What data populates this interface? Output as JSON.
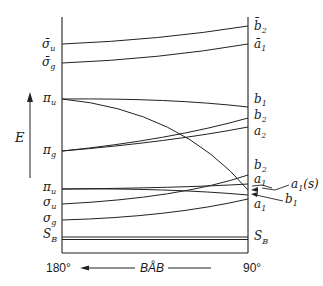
{
  "diagram": {
    "type": "correlation-diagram",
    "energy_axis_label": "E",
    "x_axis": {
      "left_value": "180°",
      "right_value": "90°",
      "label": "BÅB",
      "arrow_direction": "left"
    },
    "left_levels": [
      {
        "id": "sigma_u_star",
        "symbol": "σ̄",
        "sub": "u"
      },
      {
        "id": "sigma_g_star",
        "symbol": "σ̄",
        "sub": "g"
      },
      {
        "id": "pi_u_upper",
        "symbol": "π",
        "sub": "u"
      },
      {
        "id": "pi_g",
        "symbol": "π",
        "sub": "g"
      },
      {
        "id": "pi_u_lower",
        "symbol": "π",
        "sub": "u"
      },
      {
        "id": "sigma_u",
        "symbol": "σ",
        "sub": "u"
      },
      {
        "id": "sigma_g",
        "symbol": "σ",
        "sub": "g"
      },
      {
        "id": "S_B_left",
        "symbol": "S",
        "sub": "B"
      }
    ],
    "right_levels": [
      {
        "id": "b2_star",
        "symbol": "b̄",
        "sub": "2"
      },
      {
        "id": "a1_star",
        "symbol": "ā",
        "sub": "1"
      },
      {
        "id": "b1_upper",
        "symbol": "b",
        "sub": "1"
      },
      {
        "id": "b2_upper",
        "symbol": "b",
        "sub": "2"
      },
      {
        "id": "a2",
        "symbol": "a",
        "sub": "2"
      },
      {
        "id": "b2_lower",
        "symbol": "b",
        "sub": "2"
      },
      {
        "id": "a1_mid",
        "symbol": "a",
        "sub": "1"
      },
      {
        "id": "a1_lower",
        "symbol": "a",
        "sub": "1"
      },
      {
        "id": "S_B_right",
        "symbol": "S",
        "sub": "B"
      }
    ],
    "callouts": [
      {
        "id": "a1s",
        "symbol": "a",
        "sub": "1",
        "suffix": "(s)"
      },
      {
        "id": "b1_callout",
        "symbol": "b",
        "sub": "1"
      }
    ],
    "correlations": [
      {
        "from": "σ̄u",
        "to": "b̄2"
      },
      {
        "from": "σ̄g",
        "to": "ā1"
      },
      {
        "from": "πu",
        "to": "b1"
      },
      {
        "from": "πu",
        "to": "a1(s)"
      },
      {
        "from": "πg",
        "to": "b2"
      },
      {
        "from": "πg",
        "to": "a2"
      },
      {
        "from": "πu",
        "to": "a1"
      },
      {
        "from": "πu",
        "to": "b1"
      },
      {
        "from": "σu",
        "to": "b2"
      },
      {
        "from": "σg",
        "to": "a1"
      },
      {
        "from": "SB",
        "to": "SB"
      }
    ]
  }
}
